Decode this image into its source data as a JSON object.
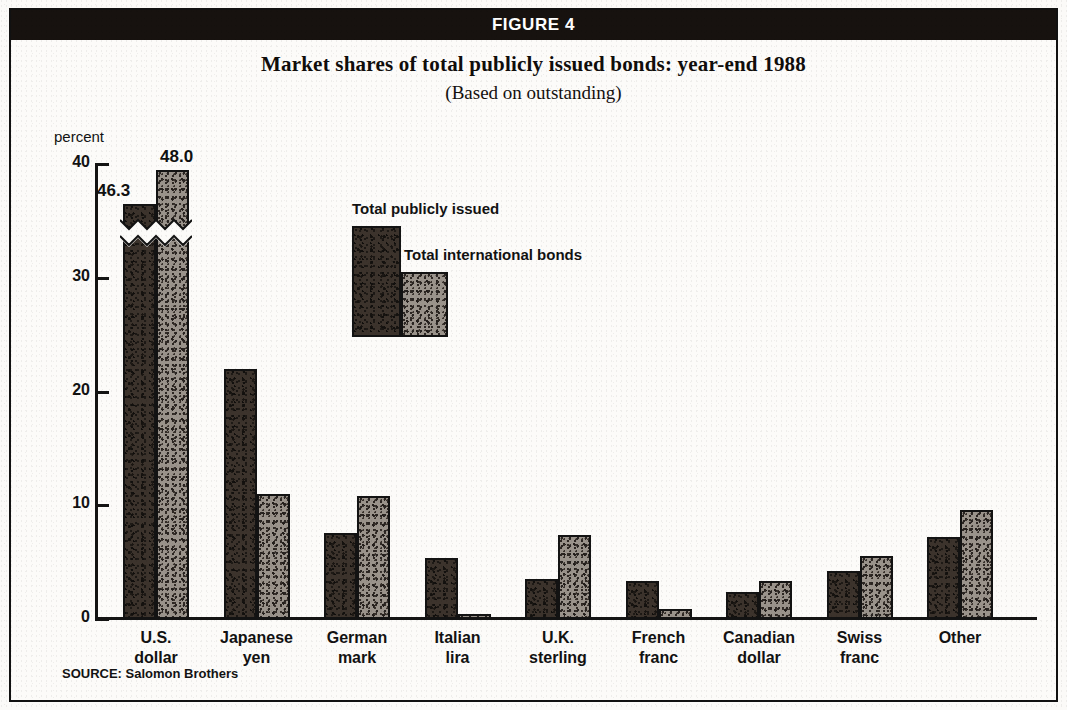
{
  "figure": {
    "banner_label": "FIGURE 4",
    "title": "Market shares of total publicly issued bonds: year-end 1988",
    "subtitle": "(Based on outstanding)",
    "source": "SOURCE: Salomon Brothers",
    "y_unit_label": "percent"
  },
  "legend": {
    "series_1_label": "Total publicly issued",
    "series_2_label": "Total international bonds"
  },
  "colors": {
    "banner_background": "#17120f",
    "banner_text": "#ffffff",
    "series_1_fill": "#3c332c",
    "series_2_fill": "#9a938b",
    "axis": "#141414",
    "page_background": "#fcfbf9"
  },
  "axis": {
    "tick_0": "0",
    "tick_10": "10",
    "tick_20": "20",
    "tick_30": "30",
    "tick_40": "40"
  },
  "annotations": {
    "usd_publicly_issued_value": "46.3",
    "usd_international_value": "48.0"
  },
  "chart_data": {
    "type": "bar",
    "title": "Market shares of total publicly issued bonds: year-end 1988",
    "subtitle": "(Based on outstanding)",
    "xlabel": "",
    "ylabel": "percent",
    "ylim": [
      0,
      40
    ],
    "yticks": [
      0,
      10,
      20,
      30,
      40
    ],
    "grid": false,
    "legend_position": "inside-upper-center",
    "broken_axis_note": "U.S. dollar bars are truncated with a zig-zag break; true values labelled above bars",
    "categories": [
      "U.S. dollar",
      "Japanese yen",
      "German mark",
      "Italian lira",
      "U.K. sterling",
      "French franc",
      "Canadian dollar",
      "Swiss franc",
      "Other"
    ],
    "category_lines": [
      [
        "U.S.",
        "dollar"
      ],
      [
        "Japanese",
        "yen"
      ],
      [
        "German",
        "mark"
      ],
      [
        "Italian",
        "lira"
      ],
      [
        "U.K.",
        "sterling"
      ],
      [
        "French",
        "franc"
      ],
      [
        "Canadian",
        "dollar"
      ],
      [
        "Swiss",
        "franc"
      ],
      [
        "Other",
        ""
      ]
    ],
    "series": [
      {
        "name": "Total publicly issued",
        "values": [
          46.3,
          22.0,
          7.6,
          5.4,
          3.5,
          3.3,
          2.4,
          4.2,
          7.2
        ],
        "truncated_index": 0,
        "drawn_values": [
          36.5,
          22.0,
          7.6,
          5.4,
          3.5,
          3.3,
          2.4,
          4.2,
          7.2
        ]
      },
      {
        "name": "Total international bonds",
        "values": [
          48.0,
          11.0,
          10.8,
          0.4,
          7.4,
          0.9,
          3.3,
          5.5,
          9.6
        ],
        "truncated_index": 0,
        "drawn_values": [
          39.5,
          11.0,
          10.8,
          0.4,
          7.4,
          0.9,
          3.3,
          5.5,
          9.6
        ]
      }
    ],
    "annotated_labels": [
      {
        "category": "U.S. dollar",
        "series": "Total publicly issued",
        "label": "46.3"
      },
      {
        "category": "U.S. dollar",
        "series": "Total international bonds",
        "label": "48.0"
      }
    ],
    "source": "SOURCE: Salomon Brothers"
  }
}
